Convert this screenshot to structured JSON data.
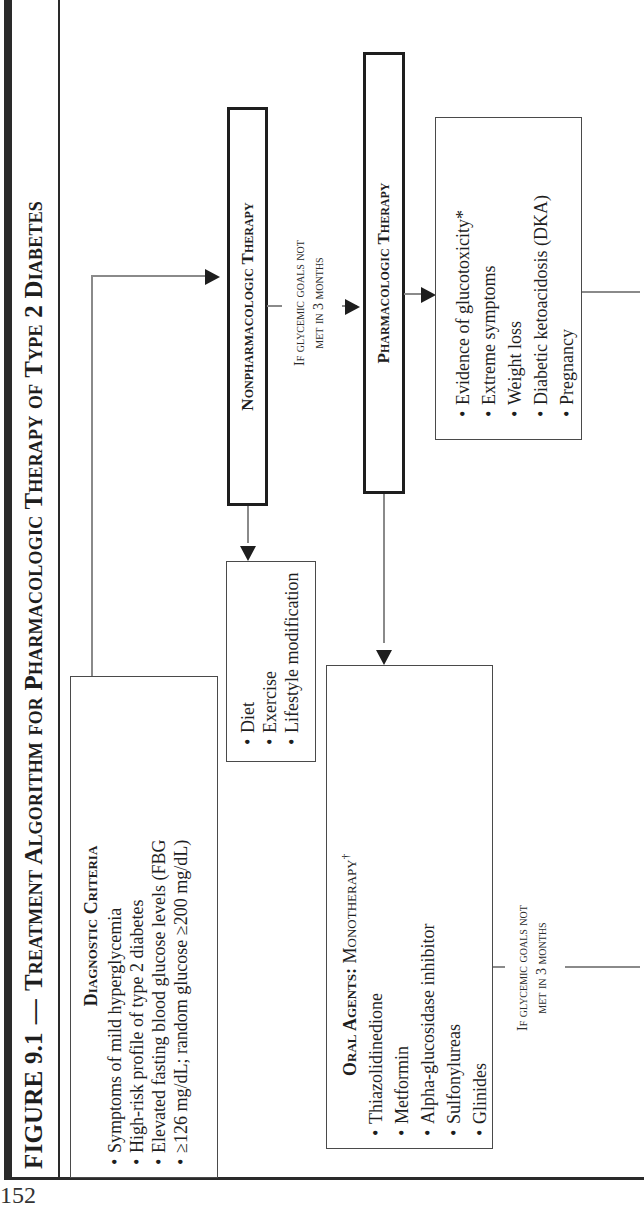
{
  "title": {
    "figure_label": "FIGURE 9.1",
    "dash": "—",
    "text": "Treatment Algorithm for Pharmacologic Therapy of Type 2 Diabetes"
  },
  "diagnostic": {
    "heading": "Diagnostic Criteria",
    "items": [
      "Symptoms of mild hyperglycemia",
      "High-risk profile of type 2 diabetes",
      "Elevated fasting blood glucose levels (FBG",
      "≥126 mg/dL; random glucose ≥200 mg/dL)"
    ]
  },
  "nonpharm": {
    "label": "Nonpharmacologic Therapy",
    "items": [
      "Diet",
      "Exercise",
      "Lifestyle modification"
    ]
  },
  "condition_1": {
    "line1": "If glycemic goals not",
    "line2": "met in 3 months"
  },
  "pharm": {
    "label": "Pharmacologic Therapy"
  },
  "glucotoxicity": {
    "items": [
      "Evidence of glucotoxicity*",
      "Extreme symptoms",
      "Weight loss",
      "Diabetic ketoacidosis (DKA)",
      "Pregnancy"
    ]
  },
  "oral_agents": {
    "heading_bold": "Oral Agents:",
    "heading_rest": " Monotherapy",
    "heading_mark": "†",
    "items": [
      "Thiazolidinedione",
      "Metformin",
      "Alpha-glucosidase inhibitor",
      "Sulfonylureas",
      "Glinides"
    ]
  },
  "condition_2": {
    "line1": "If glycemic goals not",
    "line2": "met in 3 months"
  },
  "page_number": "152"
}
